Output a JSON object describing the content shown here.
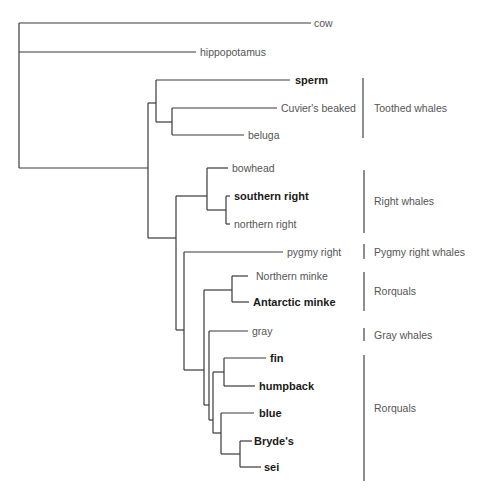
{
  "diagram": {
    "type": "phylogenetic-tree",
    "colors": {
      "branch": "#3a3a3a",
      "label": "#555555",
      "label_bold": "#1a1a1a"
    },
    "taxa": [
      {
        "id": "cow",
        "label": "cow",
        "bold": false
      },
      {
        "id": "hippopotamus",
        "label": "hippopotamus",
        "bold": false
      },
      {
        "id": "sperm",
        "label": "sperm",
        "bold": true
      },
      {
        "id": "cuviers",
        "label": "Cuvier's beaked",
        "bold": false
      },
      {
        "id": "beluga",
        "label": "beluga",
        "bold": false
      },
      {
        "id": "bowhead",
        "label": "bowhead",
        "bold": false
      },
      {
        "id": "southern_right",
        "label": "southern right",
        "bold": true
      },
      {
        "id": "northern_right",
        "label": "northern right",
        "bold": false
      },
      {
        "id": "pygmy_right",
        "label": "pygmy right",
        "bold": false
      },
      {
        "id": "northern_minke",
        "label": "Northern minke",
        "bold": false
      },
      {
        "id": "antarctic_minke",
        "label": "Antarctic minke",
        "bold": true
      },
      {
        "id": "gray",
        "label": "gray",
        "bold": false
      },
      {
        "id": "fin",
        "label": "fin",
        "bold": true
      },
      {
        "id": "humpback",
        "label": "humpback",
        "bold": true
      },
      {
        "id": "blue",
        "label": "blue",
        "bold": true
      },
      {
        "id": "brydes",
        "label": "Bryde's",
        "bold": true
      },
      {
        "id": "sei",
        "label": "sei",
        "bold": true
      }
    ],
    "groups": [
      {
        "label": "Toothed whales",
        "members": [
          "sperm",
          "cuviers",
          "beluga"
        ]
      },
      {
        "label": "Right whales",
        "members": [
          "bowhead",
          "southern_right",
          "northern_right"
        ]
      },
      {
        "label": "Pygmy right whales",
        "members": [
          "pygmy_right"
        ]
      },
      {
        "label": "Rorquals",
        "members": [
          "northern_minke",
          "antarctic_minke"
        ]
      },
      {
        "label": "Gray whales",
        "members": [
          "gray"
        ]
      },
      {
        "label": "Rorquals",
        "members": [
          "fin",
          "humpback",
          "blue",
          "brydes",
          "sei"
        ]
      }
    ],
    "newick": "(cow,(hippopotamus,((sperm,(Cuvier's beaked,beluga)),((bowhead,(southern right,northern right)),(pygmy right,((Northern minke,Antarctic minke),(gray,((fin,humpback),(blue,(Bryde's,sei))))))))));"
  }
}
